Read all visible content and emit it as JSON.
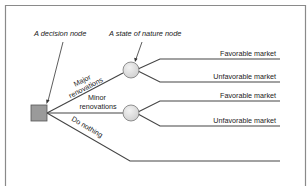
{
  "diagram": {
    "type": "decision-tree",
    "callouts": {
      "decision_node": "A decision node",
      "state_of_nature_node": "A state of nature node"
    },
    "decision": {
      "alternatives": [
        {
          "label_line1": "Major",
          "label_line2": "renovations",
          "outcomes": [
            "Favorable market",
            "Unfavorable market"
          ]
        },
        {
          "label_line1": "Minor",
          "label_line2": "renovations",
          "outcomes": [
            "Favorable market",
            "Unfavorable market"
          ]
        },
        {
          "label_line1": "Do nothing",
          "outcomes": []
        }
      ]
    },
    "colors": {
      "decision_node_fill": "#9a9a9a",
      "chance_node_fill": "#e2e2e2",
      "line": "#444444",
      "frame": "#8a8a8a"
    }
  }
}
